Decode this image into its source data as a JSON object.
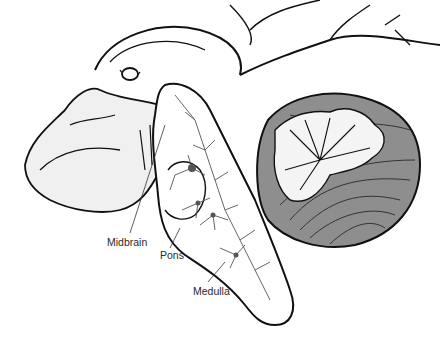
{
  "figure": {
    "labels": [
      {
        "id": "midbrain",
        "text": "Midbrain",
        "x": 107,
        "y": 236
      },
      {
        "id": "pons",
        "text": "Pons",
        "x": 160,
        "y": 249
      },
      {
        "id": "medulla",
        "text": "Medulla",
        "x": 193,
        "y": 285
      }
    ]
  },
  "colors": {
    "outline": "#111111",
    "vessel": "#555555",
    "cerebellum_gray": "#8e8e8e",
    "white_matter": "#f4f4f4",
    "background": "#ffffff"
  }
}
